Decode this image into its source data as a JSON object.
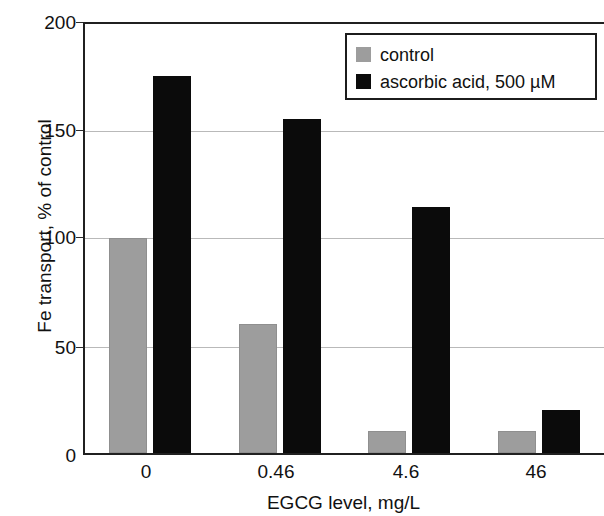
{
  "chart_data": {
    "type": "bar",
    "title": "",
    "xlabel": "EGCG level, mg/L",
    "ylabel": "Fe transport, % of control",
    "categories": [
      "0",
      "0.46",
      "4.6",
      "46"
    ],
    "series": [
      {
        "name": "control",
        "color": "#9d9d9d",
        "values": [
          100,
          60,
          10,
          10
        ]
      },
      {
        "name": "ascorbic acid, 500 µM",
        "color": "#0b0b0b",
        "values": [
          175,
          155,
          114,
          20
        ]
      }
    ],
    "ylim": [
      0,
      200
    ],
    "yticks": [
      0,
      50,
      100,
      150,
      200
    ],
    "ytick_labels": [
      "0",
      "50",
      "100",
      "150",
      "200"
    ],
    "grid": "horizontal",
    "legend_position": "top-right",
    "legend_entries": [
      "control",
      "ascorbic acid, 500 µM"
    ]
  },
  "axes": {
    "y_title": "Fe transport, % of control",
    "x_title": "EGCG level, mg/L"
  },
  "ticks": {
    "y": [
      "200",
      "150",
      "100",
      "50",
      "0"
    ],
    "x": [
      "0",
      "0.46",
      "4.6",
      "46"
    ]
  },
  "legend": {
    "control_label": "control",
    "ascorbic_label": "ascorbic acid, 500 µM"
  }
}
